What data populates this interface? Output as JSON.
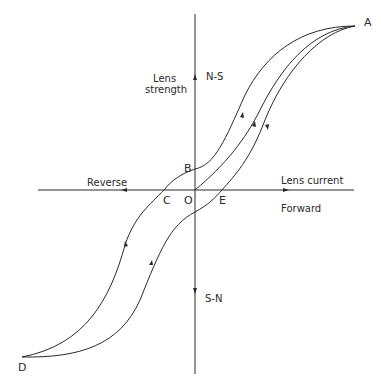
{
  "diagram": {
    "type": "hysteresis-loop",
    "axes": {
      "vertical": {
        "title_line1": "Lens",
        "title_line2": "strength",
        "positive_label": "N-S",
        "negative_label": "S-N"
      },
      "horizontal": {
        "title": "Lens current",
        "positive_label": "Forward",
        "negative_label": "Reverse"
      }
    },
    "points": {
      "A": "A",
      "B": "B",
      "C": "C",
      "O": "O",
      "D": "D",
      "E": "E"
    },
    "curves": [
      {
        "name": "initial-magnetization",
        "path": "O to A"
      },
      {
        "name": "descending-branch",
        "path": "A to B to C to D"
      },
      {
        "name": "ascending-branch",
        "path": "D to E to A"
      }
    ],
    "colors": {
      "line": "#2a2a2a",
      "background": "#ffffff"
    }
  }
}
